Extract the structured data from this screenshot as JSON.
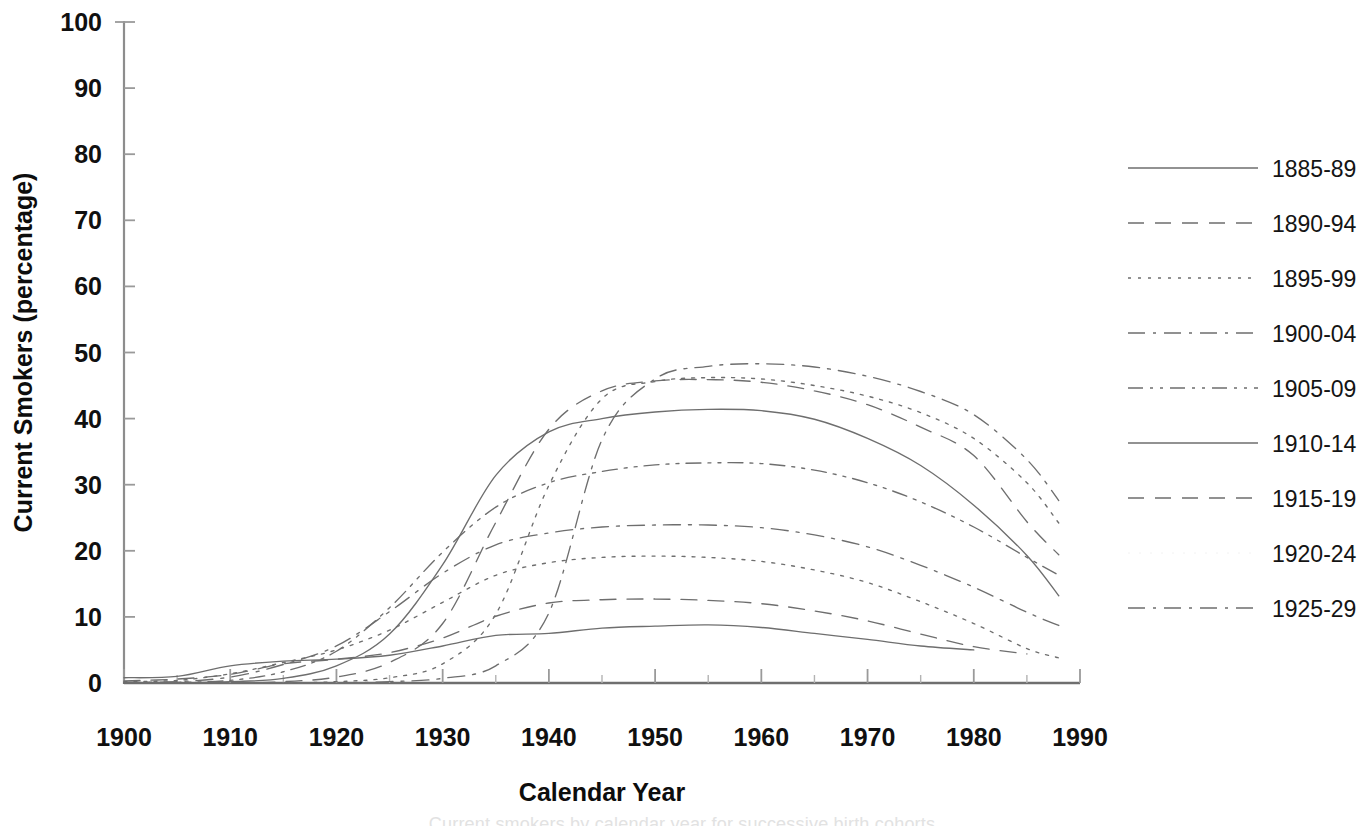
{
  "figure": {
    "background_color": "#ffffff",
    "line_color": "#6e6e6e",
    "axis_color": "#8d8d8d",
    "text_color": "#121212",
    "caption_partial": "Current smokers by calendar year for successive birth cohorts"
  },
  "axes": {
    "x_title": "Calendar Year",
    "y_title": "Current Smokers (percentage)",
    "x_ticks": [
      "1900",
      "1910",
      "1920",
      "1930",
      "1940",
      "1950",
      "1960",
      "1970",
      "1980",
      "1990"
    ],
    "y_ticks": [
      "0",
      "10",
      "20",
      "30",
      "40",
      "50",
      "60",
      "70",
      "80",
      "90",
      "100"
    ]
  },
  "legend": {
    "position": "right",
    "entries": [
      {
        "label": "1885-89",
        "dash": "none",
        "visible_sample": true
      },
      {
        "label": "1890-94",
        "dash": "dashed",
        "visible_sample": true
      },
      {
        "label": "1895-99",
        "dash": "dotted",
        "visible_sample": true
      },
      {
        "label": "1900-04",
        "dash": "dashdot",
        "visible_sample": true
      },
      {
        "label": "1905-09",
        "dash": "dashdotdot",
        "visible_sample": true
      },
      {
        "label": "1910-14",
        "dash": "none",
        "visible_sample": true
      },
      {
        "label": "1915-19",
        "dash": "dashed",
        "visible_sample": true
      },
      {
        "label": "1920-24",
        "dash": "dotted",
        "visible_sample": false
      },
      {
        "label": "1925-29",
        "dash": "dashdot",
        "visible_sample": true
      }
    ]
  },
  "chart_data": {
    "type": "line",
    "title": "",
    "subtitle": "",
    "xlabel": "Calendar Year",
    "ylabel": "Current Smokers (percentage)",
    "xlim": [
      1900,
      1990
    ],
    "ylim": [
      0,
      100
    ],
    "xticks": [
      1900,
      1910,
      1920,
      1930,
      1940,
      1950,
      1960,
      1970,
      1980,
      1990
    ],
    "yticks": [
      0,
      10,
      20,
      30,
      40,
      50,
      60,
      70,
      80,
      90,
      100
    ],
    "grid": false,
    "legend_position": "right",
    "x": [
      1900,
      1905,
      1910,
      1915,
      1920,
      1925,
      1930,
      1935,
      1940,
      1945,
      1950,
      1955,
      1960,
      1965,
      1970,
      1975,
      1980,
      1985,
      1988
    ],
    "series": [
      {
        "name": "1885-89",
        "dash": "none",
        "values": [
          0.8,
          1.0,
          2.6,
          3.3,
          3.6,
          4.2,
          5.6,
          7.2,
          7.5,
          8.3,
          8.6,
          8.8,
          8.4,
          7.5,
          6.6,
          5.6,
          5.0,
          null,
          null
        ],
        "peak": {
          "year": 1953,
          "value": 8.8
        },
        "end": {
          "year": 1981,
          "value": 5.0
        }
      },
      {
        "name": "1890-94",
        "dash": "dashed",
        "values": [
          0.3,
          0.6,
          1.3,
          2.9,
          3.6,
          4.6,
          6.8,
          10.1,
          12.1,
          12.6,
          12.7,
          12.5,
          12.0,
          10.9,
          9.4,
          7.4,
          5.5,
          4.4,
          null
        ],
        "peak": {
          "year": 1950,
          "value": 12.7
        },
        "end": {
          "year": 1985,
          "value": 4.4
        }
      },
      {
        "name": "1895-99",
        "dash": "dotted",
        "values": [
          0.2,
          0.4,
          1.4,
          3.1,
          5.0,
          8.0,
          12.2,
          16.3,
          18.2,
          19.0,
          19.2,
          19.0,
          18.4,
          17.1,
          15.2,
          12.3,
          9.0,
          5.2,
          3.8
        ],
        "peak": {
          "year": 1950,
          "value": 19.2
        },
        "end": {
          "year": 1988,
          "value": 3.8
        }
      },
      {
        "name": "1900-04",
        "dash": "dashdot",
        "values": [
          0.1,
          0.2,
          0.9,
          2.8,
          5.6,
          10.8,
          16.6,
          20.9,
          22.7,
          23.6,
          23.9,
          23.9,
          23.5,
          22.4,
          20.6,
          17.8,
          14.5,
          10.7,
          8.7
        ],
        "peak": {
          "year": 1957,
          "value": 23.9
        },
        "end": {
          "year": 1988,
          "value": 8.7
        }
      },
      {
        "name": "1905-09",
        "dash": "dashdotdot",
        "values": [
          0.1,
          0.1,
          0.4,
          1.7,
          4.8,
          11.4,
          19.8,
          26.6,
          30.3,
          32.0,
          33.0,
          33.3,
          33.2,
          32.2,
          30.3,
          27.4,
          23.6,
          19.0,
          16.3
        ],
        "peak": {
          "year": 1957,
          "value": 33.3
        },
        "end": {
          "year": 1988,
          "value": 16.3
        }
      },
      {
        "name": "1910-14",
        "dash": "none",
        "values": [
          0.0,
          0.0,
          0.2,
          0.7,
          2.6,
          7.4,
          17.9,
          31.4,
          38.0,
          40.0,
          41.0,
          41.4,
          41.2,
          39.9,
          37.0,
          32.9,
          26.9,
          19.3,
          13.2
        ],
        "peak": {
          "year": 1955,
          "value": 41.4
        },
        "end": {
          "year": 1988,
          "value": 13.2
        }
      },
      {
        "name": "1915-19",
        "dash": "dashed",
        "values": [
          0.0,
          0.0,
          0.0,
          0.2,
          0.9,
          3.1,
          9.0,
          24.3,
          38.4,
          44.2,
          45.7,
          45.9,
          45.5,
          44.2,
          42.1,
          38.7,
          34.4,
          24.4,
          19.4
        ],
        "peak": {
          "year": 1957,
          "value": 45.9
        },
        "end": {
          "year": 1988,
          "value": 19.4
        }
      },
      {
        "name": "1920-24",
        "dash": "dotted",
        "values": [
          0.0,
          0.0,
          0.0,
          0.0,
          0.2,
          0.8,
          2.9,
          10.4,
          29.9,
          43.0,
          45.6,
          46.2,
          46.0,
          45.0,
          43.4,
          40.9,
          37.0,
          30.3,
          24.2
        ],
        "peak": {
          "year": 1956,
          "value": 46.2
        },
        "end": {
          "year": 1988,
          "value": 24.2
        }
      },
      {
        "name": "1925-29",
        "dash": "dashdot",
        "values": [
          0.0,
          0.0,
          0.0,
          0.0,
          0.0,
          0.2,
          0.7,
          2.6,
          10.6,
          36.8,
          46.0,
          47.9,
          48.3,
          47.8,
          46.4,
          44.1,
          40.6,
          33.8,
          27.6
        ],
        "peak": {
          "year": 1960,
          "value": 48.3
        },
        "end": {
          "year": 1988,
          "value": 27.6
        }
      }
    ]
  }
}
